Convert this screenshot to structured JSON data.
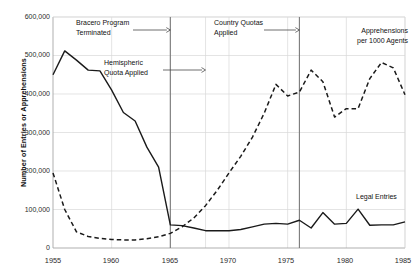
{
  "chart_data": {
    "type": "line",
    "title": "",
    "subtitle": "",
    "xlabel": "",
    "ylabel": "Number of Entries or Apprehensions",
    "xlim": [
      1955,
      1985
    ],
    "ylim": [
      0,
      600000
    ],
    "xticks": [
      1955,
      1960,
      1965,
      1970,
      1975,
      1980,
      1985
    ],
    "xtick_labels": [
      "1955",
      "1960",
      "1965",
      "1970",
      "1975",
      "1980",
      "1985"
    ],
    "yticks": [
      0,
      100000,
      200000,
      300000,
      400000,
      500000,
      600000
    ],
    "ytick_labels": [
      "0",
      "100,000",
      "200,000",
      "300,000",
      "400,000",
      "500,000",
      "600,000"
    ],
    "grid": true,
    "grid_color": "#d9d9d9",
    "legend_position": "inline-annotations",
    "series": [
      {
        "name": "Legal Entries",
        "style": "solid",
        "color": "#1a1a1a",
        "x": [
          1955,
          1956,
          1957,
          1958,
          1959,
          1960,
          1961,
          1962,
          1963,
          1964,
          1965,
          1966,
          1967,
          1968,
          1969,
          1970,
          1971,
          1972,
          1973,
          1974,
          1975,
          1976,
          1977,
          1978,
          1979,
          1980,
          1981,
          1982,
          1983,
          1984,
          1985
        ],
        "values": [
          450000,
          512000,
          488000,
          462000,
          460000,
          410000,
          352000,
          330000,
          262000,
          210000,
          60000,
          58000,
          52000,
          45000,
          45000,
          45000,
          48000,
          55000,
          62000,
          64000,
          62000,
          72000,
          52000,
          92000,
          62000,
          64000,
          101000,
          59000,
          60000,
          60000,
          68000
        ]
      },
      {
        "name": "Apprehensions per 1000 Agents",
        "style": "dashed",
        "color": "#1a1a1a",
        "x": [
          1955,
          1956,
          1957,
          1958,
          1959,
          1960,
          1961,
          1962,
          1963,
          1964,
          1965,
          1966,
          1967,
          1968,
          1969,
          1970,
          1971,
          1972,
          1973,
          1974,
          1975,
          1976,
          1977,
          1978,
          1979,
          1980,
          1981,
          1982,
          1983,
          1984,
          1985
        ],
        "values": [
          195000,
          100000,
          42000,
          30000,
          25000,
          22000,
          21000,
          21000,
          24000,
          29000,
          38000,
          55000,
          78000,
          110000,
          150000,
          195000,
          238000,
          288000,
          350000,
          425000,
          395000,
          405000,
          462000,
          432000,
          340000,
          362000,
          362000,
          440000,
          482000,
          468000,
          398000
        ]
      }
    ],
    "vlines": [
      {
        "x": 1965,
        "color": "#7a7a7a"
      },
      {
        "x": 1976,
        "color": "#7a7a7a"
      }
    ],
    "annotations": [
      {
        "name": "bracero-program-terminated",
        "text_line1": "Bracero Program",
        "text_line2": "Terminated",
        "arrow_to_year": 1965
      },
      {
        "name": "hemispheric-quota-applied",
        "text_line1": "Hemispheric",
        "text_line2": "Quota Applied",
        "arrow_to_year": 1968
      },
      {
        "name": "country-quotas-applied",
        "text_line1": "Country Quotas",
        "text_line2": "Applied",
        "arrow_to_year": 1976
      },
      {
        "name": "apprehensions-label",
        "text_line1": "Apprehensions",
        "text_line2": "per 1000 Agents",
        "arrow_to_year": null
      },
      {
        "name": "legal-entries-label",
        "text_line1": "Legal Entries",
        "text_line2": "",
        "arrow_to_year": null
      }
    ]
  }
}
